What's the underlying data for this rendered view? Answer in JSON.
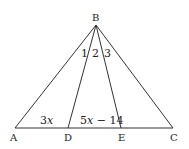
{
  "diagram": {
    "type": "triangle-with-cevians",
    "colors": {
      "stroke": "#333333",
      "text": "#222222",
      "background": "#ffffff"
    },
    "points": {
      "B": {
        "label": "B",
        "x": 96,
        "y": 25
      },
      "A": {
        "label": "A",
        "x": 15,
        "y": 128
      },
      "D": {
        "label": "D",
        "x": 68,
        "y": 128
      },
      "E": {
        "label": "E",
        "x": 121,
        "y": 128
      },
      "C": {
        "label": "C",
        "x": 173,
        "y": 128
      }
    },
    "segments": [
      "BA",
      "BD",
      "BE",
      "BC",
      "AC"
    ],
    "angle_labels": [
      {
        "label": "1",
        "between": "BA-BD"
      },
      {
        "label": "2",
        "between": "BD-BE"
      },
      {
        "label": "3",
        "between": "BE-BC"
      }
    ],
    "segment_labels": {
      "AD": {
        "coef": "3",
        "var": "x"
      },
      "DE": {
        "coef": "5",
        "var": "x",
        "rest": " − 14"
      }
    }
  }
}
